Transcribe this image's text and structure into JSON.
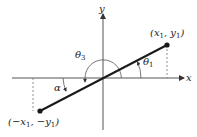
{
  "diagram": {
    "axes": {
      "x_label": "x",
      "y_label": "y"
    },
    "points": {
      "p1": {
        "label_text": "(x",
        "sub1": "1",
        "mid": ", y",
        "sub2": "1",
        "end": ")"
      },
      "p2": {
        "label_text": "(−x",
        "sub1": "1",
        "mid": ", −y",
        "sub2": "1",
        "end": ")"
      }
    },
    "angles": {
      "theta1": {
        "symbol": "θ",
        "sub": "1"
      },
      "theta3": {
        "symbol": "θ",
        "sub": "3"
      },
      "alpha": {
        "symbol": "α"
      }
    },
    "colors": {
      "line": "#1a1a1a",
      "axis": "#555555",
      "dashed": "#777777",
      "text": "#222222"
    }
  }
}
